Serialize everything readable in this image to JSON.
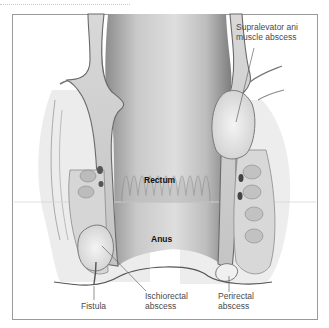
{
  "diagram": {
    "type": "anatomical-illustration",
    "colors": {
      "frame_border": "#9a9a9a",
      "label_text": "#4a4a4a",
      "structure_label_text": "#111111",
      "tissue_light": "#e6e6e6",
      "tissue_mid": "#bdbdbd",
      "tissue_dark": "#6e6e6e",
      "abscess_fill": "#ececec"
    },
    "structure_labels": {
      "rectum": "Rectum",
      "anus": "Anus"
    },
    "callouts": [
      {
        "id": "supralevator",
        "line1": "Supralevator ani",
        "line2": "muscle abscess"
      },
      {
        "id": "fistula",
        "line1": "Fistula",
        "line2": ""
      },
      {
        "id": "ischiorectal",
        "line1": "Ischiorectal",
        "line2": "abscess"
      },
      {
        "id": "perirectal",
        "line1": "Perirectal",
        "line2": "abscess"
      }
    ]
  }
}
